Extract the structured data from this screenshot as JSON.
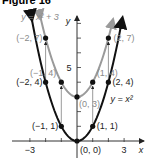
{
  "figure": {
    "title": "Figure 16"
  },
  "chart_data": {
    "type": "line",
    "title": "Figure 16",
    "xlabel": "x",
    "ylabel": "y",
    "xlim": [
      -4,
      4
    ],
    "ylim": [
      0,
      8.5
    ],
    "x_ticks": [
      -3,
      -2,
      -1,
      1,
      2,
      3
    ],
    "x_tick_labels": [
      "-3",
      "3"
    ],
    "y_ticks": [
      1,
      2,
      3,
      4,
      5,
      6,
      7,
      8
    ],
    "y_tick_labels": [
      "5"
    ],
    "grid": false,
    "series": [
      {
        "name": "y = x^2 + 3",
        "label": "y = x² + 3",
        "color": "#9a9a9a",
        "function": "x^2+3",
        "points": [
          {
            "x": -2,
            "y": 7,
            "label": "(−2, 7)"
          },
          {
            "x": -1,
            "y": 4,
            "label": "(−1, 4)"
          },
          {
            "x": 0,
            "y": 3,
            "label": "(0, 3)"
          },
          {
            "x": 1,
            "y": 4,
            "label": "(1, 4)"
          },
          {
            "x": 2,
            "y": 7,
            "label": "(2, 7)"
          }
        ]
      },
      {
        "name": "y = x^2",
        "label": "y = x²",
        "color": "#111111",
        "function": "x^2",
        "points": [
          {
            "x": -2,
            "y": 4,
            "label": "(−2, 4)"
          },
          {
            "x": -1,
            "y": 1,
            "label": "(−1, 1)"
          },
          {
            "x": 0,
            "y": 0,
            "label": "(0, 0)"
          },
          {
            "x": 1,
            "y": 1,
            "label": "(1, 1)"
          },
          {
            "x": 2,
            "y": 4,
            "label": "(2, 4)"
          }
        ]
      }
    ],
    "annotations": [
      "shift arrows from y = x² points up 3 units to y = x² + 3 points"
    ]
  }
}
